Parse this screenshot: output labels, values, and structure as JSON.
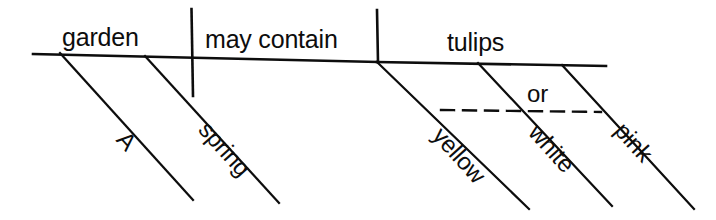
{
  "diagram": {
    "type": "reed-kellogg-sentence-diagram",
    "sentence": "A spring garden may contain yellow, white or pink tulips.",
    "baseline": {
      "subject": "garden",
      "verb": "may contain",
      "object": "tulips"
    },
    "labels": {
      "subject": "garden",
      "verb_phrase": "may contain",
      "direct_object": "tulips",
      "subject_modifier_1": "A",
      "subject_modifier_2": "spring",
      "object_modifier_1": "yellow",
      "object_modifier_2": "white",
      "object_modifier_3": "pink",
      "conjunction": "or"
    },
    "colors": {
      "ink": "#0d0d0d",
      "paper": "#ffffff"
    },
    "line_weights": {
      "baseline": 2.6,
      "divider": 2.6,
      "modifier": 2.2,
      "dashed_conjunction": 2.4
    },
    "geometry": {
      "baseline_left": {
        "x1": 33,
        "y1": 54,
        "x2": 377,
        "y2": 62
      },
      "baseline_right": {
        "x1": 377,
        "y1": 62,
        "x2": 606,
        "y2": 66
      },
      "divider_subject_verb": {
        "x1": 191,
        "y1": 9,
        "x2": 193,
        "y2": 96
      },
      "divider_verb_object": {
        "x1": 377,
        "y1": 10,
        "x2": 378,
        "y2": 62
      },
      "modifier_lines": [
        {
          "name": "A",
          "x1": 60,
          "y1": 53,
          "x2": 193,
          "y2": 200
        },
        {
          "name": "spring",
          "x1": 145,
          "y1": 56,
          "x2": 279,
          "y2": 203
        },
        {
          "name": "yellow",
          "x1": 377,
          "y1": 62,
          "x2": 529,
          "y2": 209
        },
        {
          "name": "white",
          "x1": 478,
          "y1": 63,
          "x2": 612,
          "y2": 206
        },
        {
          "name": "pink",
          "x1": 562,
          "y1": 65,
          "x2": 694,
          "y2": 209
        }
      ],
      "dashed_line": {
        "x1": 441,
        "y1": 110,
        "x2": 601,
        "y2": 112
      }
    }
  }
}
